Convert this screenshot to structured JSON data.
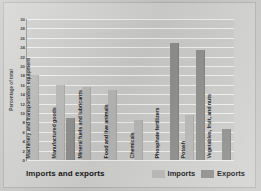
{
  "figure": {
    "caption": "Imports and exports",
    "y_axis_title": "Percentage of total"
  },
  "legend": {
    "position": "bottom-right",
    "entries": [
      {
        "label": "Imports",
        "color": "#b8b8b6",
        "swatch_name": "imports-swatch"
      },
      {
        "label": "Exports",
        "color": "#8d8d8b",
        "swatch_name": "exports-swatch"
      }
    ]
  },
  "chart_data": {
    "type": "bar",
    "title": "Imports and exports",
    "xlabel": "",
    "ylabel": "Percentage of total",
    "ylim": [
      0,
      30
    ],
    "ytick_step": 2,
    "yticks": [
      0,
      2,
      4,
      6,
      8,
      10,
      12,
      14,
      16,
      18,
      20,
      22,
      24,
      26,
      28,
      30
    ],
    "grid": true,
    "grid_axis": "y",
    "legend_position": "bottom-right",
    "categories": [
      "Machinery and transportation equipment",
      "Manufactured goods",
      "Mineral fuels and lubricants",
      "Food and live animals",
      "Chemicals",
      "Phosphate fertilizers",
      "Potash",
      "Vegetables, fruit, and nuts"
    ],
    "series": [
      {
        "name": "Imports",
        "color": "#b8b8b6",
        "values": [
          18,
          16,
          15.5,
          15,
          8.5,
          null,
          9.5,
          null
        ]
      },
      {
        "name": "Exports",
        "color": "#8d8d8b",
        "values": [
          null,
          9,
          null,
          null,
          null,
          25,
          23.5,
          6.5
        ]
      }
    ]
  }
}
